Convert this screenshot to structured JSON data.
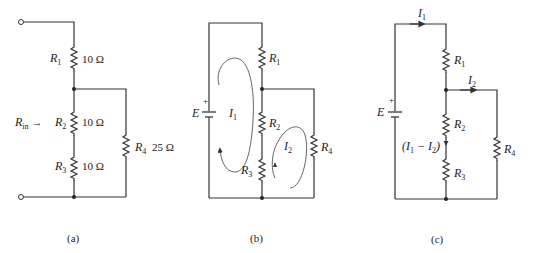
{
  "figure": {
    "panels": [
      {
        "caption": "(a)",
        "labels": {
          "r1": "R",
          "r1_sub": "1",
          "r2": "R",
          "r2_sub": "2",
          "r3": "R",
          "r3_sub": "3",
          "r4": "R",
          "r4_sub": "4",
          "rin": "R",
          "rin_sub": "in",
          "rin_arrow": "→"
        },
        "values": {
          "r1": "10 Ω",
          "r2": "10 Ω",
          "r3": "10 Ω",
          "r4": "25 Ω"
        }
      },
      {
        "caption": "(b)",
        "labels": {
          "source": "E",
          "plus": "+",
          "r1": "R",
          "r1_sub": "1",
          "r2": "R",
          "r2_sub": "2",
          "r3": "R",
          "r3_sub": "3",
          "r4": "R",
          "r4_sub": "4",
          "loop1": "I",
          "loop1_sub": "1",
          "loop2": "I",
          "loop2_sub": "2"
        }
      },
      {
        "caption": "(c)",
        "labels": {
          "source": "E",
          "plus": "+",
          "r1": "R",
          "r1_sub": "1",
          "r2": "R",
          "r2_sub": "2",
          "r3": "R",
          "r3_sub": "3",
          "r4": "R",
          "r4_sub": "4",
          "i1": "I",
          "i1_sub": "1",
          "i2": "I",
          "i2_sub": "2",
          "diff_open": "(I",
          "diff_sub1": "1",
          "diff_mid": " − I",
          "diff_sub2": "2",
          "diff_close": ")"
        }
      }
    ]
  }
}
